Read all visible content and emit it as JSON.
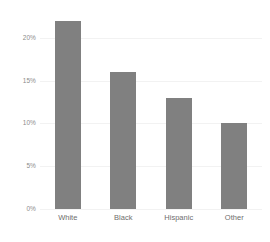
{
  "chart_data": {
    "type": "bar",
    "title": "",
    "subtitle": "",
    "xlabel": "",
    "ylabel": "",
    "categories": [
      "White",
      "Black",
      "Hispanic",
      "Other"
    ],
    "values": [
      22,
      16,
      13,
      10
    ],
    "value_suffix": "%",
    "ylim": [
      0,
      23
    ],
    "yticks": [
      0,
      5,
      10,
      15,
      20
    ],
    "ytick_labels": [
      "0%",
      "5%",
      "10%",
      "15%",
      "20%"
    ],
    "grid": true,
    "grid_axis": "y",
    "legend": false,
    "legend_position": "none",
    "bar_color": "#808080",
    "grid_color": "#f2f2f2",
    "tick_label_color": "#8c8c8c",
    "category_label_color": "#6e6e6e",
    "background_color": "#ffffff"
  }
}
